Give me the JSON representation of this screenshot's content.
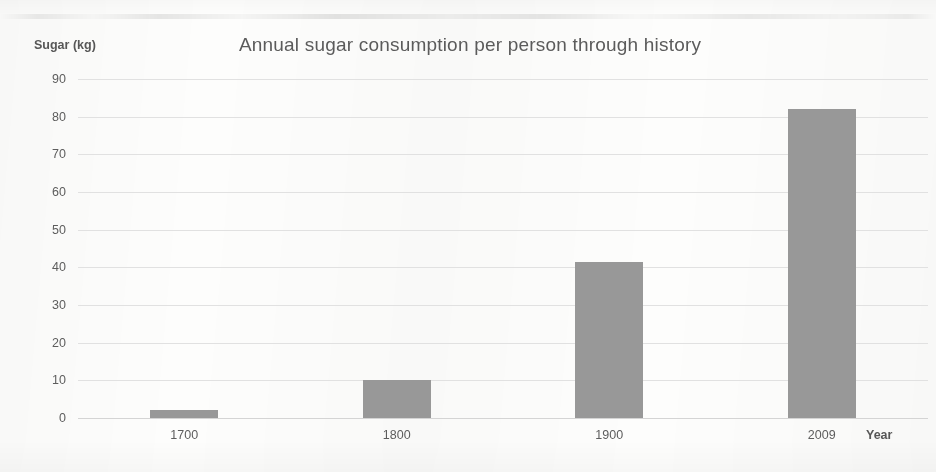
{
  "chart_data": {
    "type": "bar",
    "title": "Annual sugar consumption per person through history",
    "xlabel": "Year",
    "ylabel": "Sugar (kg)",
    "categories": [
      "1700",
      "1800",
      "1900",
      "2009"
    ],
    "values": [
      2,
      10,
      41.5,
      82
    ],
    "ylim": [
      0,
      90
    ],
    "ytick_labels": [
      "90",
      "80",
      "70",
      "60",
      "50",
      "40",
      "30",
      "20",
      "10",
      "0"
    ],
    "ytick_values": [
      90,
      80,
      70,
      60,
      50,
      40,
      30,
      20,
      10,
      0
    ],
    "ystep": 10,
    "grid": true,
    "legend": null,
    "bar_color": "#989898",
    "grid_color": "#dedede",
    "text_color": "#5d5d5d",
    "title_color": "#5b5b5b",
    "background": "#fdfdfc"
  }
}
